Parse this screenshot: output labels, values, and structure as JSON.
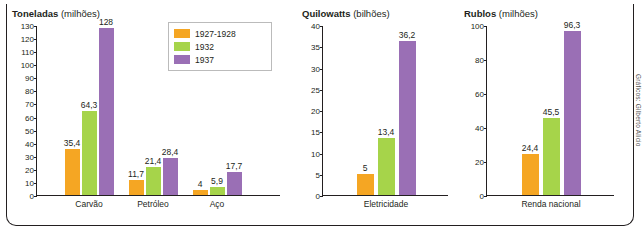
{
  "credit": "Gráficos: Gilberto Alicio",
  "legend": {
    "items": [
      {
        "label": "1927-1928",
        "color": "#f5a623"
      },
      {
        "label": "1932",
        "color": "#a6d44a"
      },
      {
        "label": "1937",
        "color": "#9a6fb5"
      }
    ]
  },
  "chart_data": [
    {
      "type": "bar",
      "title": "Toneladas",
      "subtitle": "(milhões)",
      "ylabel": "Toneladas (milhões)",
      "xlabel": "",
      "ylim": [
        0,
        130
      ],
      "yticks": [
        0,
        10,
        20,
        30,
        40,
        50,
        60,
        70,
        80,
        90,
        100,
        110,
        120,
        130
      ],
      "grid": false,
      "categories": [
        "Carvão",
        "Petróleo",
        "Aço"
      ],
      "series": [
        {
          "name": "1927-1928",
          "color": "#f5a623",
          "values": [
            35.4,
            11.7,
            4
          ],
          "labels": [
            "35,4",
            "11,7",
            "4"
          ]
        },
        {
          "name": "1932",
          "color": "#a6d44a",
          "values": [
            64.3,
            21.4,
            5.9
          ],
          "labels": [
            "64,3",
            "21,4",
            "5,9"
          ]
        },
        {
          "name": "1937",
          "color": "#9a6fb5",
          "values": [
            128,
            28.4,
            17.7
          ],
          "labels": [
            "128",
            "28,4",
            "17,7"
          ]
        }
      ]
    },
    {
      "type": "bar",
      "title": "Quilowatts",
      "subtitle": "(bilhões)",
      "ylabel": "Quilowatts (bilhões)",
      "xlabel": "",
      "ylim": [
        0,
        40
      ],
      "yticks": [
        0,
        5,
        10,
        15,
        20,
        25,
        30,
        35,
        40
      ],
      "grid": false,
      "categories": [
        "Eletricidade"
      ],
      "series": [
        {
          "name": "1927-1928",
          "color": "#f5a623",
          "values": [
            5
          ],
          "labels": [
            "5"
          ]
        },
        {
          "name": "1932",
          "color": "#a6d44a",
          "values": [
            13.4
          ],
          "labels": [
            "13,4"
          ]
        },
        {
          "name": "1937",
          "color": "#9a6fb5",
          "values": [
            36.2
          ],
          "labels": [
            "36,2"
          ]
        }
      ]
    },
    {
      "type": "bar",
      "title": "Rublos",
      "subtitle": "(milhões)",
      "ylabel": "Rublos (milhões)",
      "xlabel": "",
      "ylim": [
        0,
        100
      ],
      "yticks": [
        0,
        20,
        40,
        60,
        80,
        100
      ],
      "grid": false,
      "categories": [
        "Renda nacional"
      ],
      "series": [
        {
          "name": "1927-1928",
          "color": "#f5a623",
          "values": [
            24.4
          ],
          "labels": [
            "24,4"
          ]
        },
        {
          "name": "1932",
          "color": "#a6d44a",
          "values": [
            45.5
          ],
          "labels": [
            "45,5"
          ]
        },
        {
          "name": "1937",
          "color": "#9a6fb5",
          "values": [
            96.3
          ],
          "labels": [
            "96,3"
          ]
        }
      ]
    }
  ]
}
